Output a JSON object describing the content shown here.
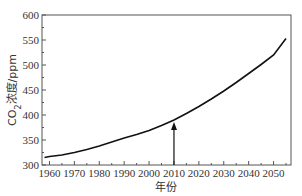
{
  "chart_data": {
    "type": "line",
    "title": "",
    "xlabel": "年份",
    "ylabel": "CO2浓度/ppm",
    "ylabel_parts": {
      "prefix": "CO",
      "subscript": "2",
      "suffix": "浓度/ppm"
    },
    "xlim": [
      1957,
      2057
    ],
    "ylim": [
      300,
      600
    ],
    "x_ticks": [
      1960,
      1970,
      1980,
      1990,
      2000,
      2010,
      2020,
      2030,
      2040,
      2050
    ],
    "y_ticks": [
      300,
      350,
      400,
      450,
      500,
      550,
      600
    ],
    "grid": false,
    "legend": null,
    "series": [
      {
        "name": "CO2浓度",
        "x": [
          1958,
          1960,
          1965,
          1970,
          1975,
          1980,
          1985,
          1990,
          1995,
          2000,
          2005,
          2010,
          2015,
          2020,
          2025,
          2030,
          2035,
          2040,
          2045,
          2050,
          2055
        ],
        "values": [
          315,
          317,
          320,
          325,
          331,
          338,
          346,
          354,
          361,
          369,
          379,
          390,
          403,
          417,
          432,
          448,
          465,
          483,
          501,
          520,
          553
        ]
      }
    ],
    "annotations": [
      {
        "type": "arrow",
        "x": 2010,
        "from_y": 300,
        "to_y": 390,
        "text": ""
      }
    ]
  }
}
